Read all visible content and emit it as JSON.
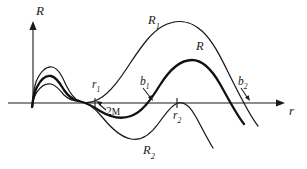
{
  "figure": {
    "background_color": "#ffffff",
    "ink_color": "#1a1a1a",
    "width": 307,
    "height": 169
  },
  "axes": {
    "vertical": {
      "label": "R",
      "name": "R-axis",
      "x_px": 33,
      "top_px": 22,
      "bottom_px": 107,
      "has_arrow": true
    },
    "horizontal": {
      "label": "r",
      "name": "r-axis",
      "y_px": 103,
      "left_px": 8,
      "right_px": 285,
      "has_arrow": true
    }
  },
  "ticks": [
    {
      "label": "r",
      "subscript": "1",
      "x_px": 95,
      "y_px": 103
    },
    {
      "label": "r",
      "subscript": "2",
      "x_px": 177,
      "y_px": 103
    }
  ],
  "annotations": [
    {
      "name": "label-2M",
      "text": "2",
      "smallcaps": "M",
      "x_px": 106,
      "y_px": 106,
      "arrow_to_x": 96,
      "arrow_to_y": 100
    },
    {
      "name": "label-b1",
      "text": "b",
      "subscript": "1",
      "x_px": 140,
      "y_px": 76,
      "arrow_to_x": 152,
      "arrow_to_y": 101
    },
    {
      "name": "label-b2",
      "text": "b",
      "subscript": "2",
      "x_px": 238,
      "y_px": 76,
      "arrow_to_x": 247,
      "arrow_to_y": 101
    }
  ],
  "curve_labels": [
    {
      "name": "label-R1",
      "text": "R",
      "subscript": "1",
      "x_px": 148,
      "y_px": 14
    },
    {
      "name": "label-R",
      "text": "R",
      "subscript": "",
      "x_px": 196,
      "y_px": 40
    },
    {
      "name": "label-R2",
      "text": "R",
      "subscript": "2",
      "x_px": 143,
      "y_px": 144
    }
  ],
  "chart_data": {
    "type": "line",
    "title": "",
    "xlabel": "r",
    "ylabel": "R",
    "grid": false,
    "legend": "inline-curve-labels",
    "axis_origin_px": {
      "x": 33,
      "y": 103
    },
    "series": [
      {
        "name": "R1",
        "label": "R₁",
        "style": "thin",
        "description": "Upper branch: steep rise from origin to a small early hump, dips through the common crossing near r1, then climbs to a tall broad maximum and falls steeply through b2-side to end below the axis.",
        "path": "M 32,107 C 33,96 34,88 36,82 C 40,72 46,66 52,67 C 58,68 62,76 66,85 C 70,93 74,99 79,101 C 86,104 92,103 99,99 C 110,93 120,79 131,62 C 143,44 152,32 163,26 C 176,19 190,20 202,31 C 214,42 222,60 232,80 C 241,98 250,116 258,126"
      },
      {
        "name": "R",
        "label": "R",
        "style": "bold",
        "description": "Middle bold branch: smaller early hump, descends below axis into a shallow trough, rises through b1 at the axis, peaks at a moderate maximum, then falls through b2 and continues below the axis.",
        "path": "M 32,107 C 33,98 35,91 37,87 C 41,79 46,75 51,76 C 56,77 60,83 64,90 C 68,96 73,100 79,101 C 86,103 93,106 100,111 C 110,117 120,120 131,116 C 142,112 150,101 160,85 C 170,69 180,60 192,60 C 203,60 212,70 220,84 C 228,98 236,114 244,124"
      },
      {
        "name": "R2",
        "label": "R₂",
        "style": "thin",
        "description": "Lower branch: lowest early hump, plunges into a deep trough well below the axis, rises to touch near the axis at r2, then drops steeply downward.",
        "path": "M 32,107 C 33,100 35,95 37,92 C 41,86 46,83 51,84 C 56,85 60,90 64,95 C 68,99 73,101 79,101 C 87,102 95,108 103,118 C 112,129 121,137 131,139 C 141,141 150,135 158,124 C 166,113 172,105 178,103 C 184,101 190,106 196,117 C 202,128 208,140 213,148"
      }
    ]
  }
}
